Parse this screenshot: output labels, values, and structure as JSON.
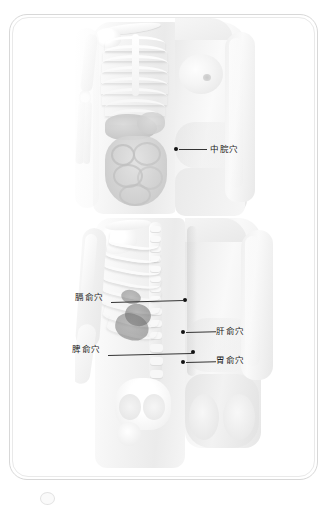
{
  "card": {
    "background_color": "#ffffff",
    "border_color": "#d8d8d8"
  },
  "panels": [
    {
      "id": "front-torso",
      "view": "anterior",
      "description": "Front view of female torso, left half showing ribcage and abdominal organs, right half showing skin",
      "labels": [
        {
          "name": "zhongwan",
          "text": "中脘穴",
          "dot": {
            "x": 163,
            "y": 131
          },
          "label": {
            "x": 199,
            "y": 126
          },
          "line": {
            "x": 168,
            "y": 131,
            "length": 28
          }
        }
      ]
    },
    {
      "id": "back-torso",
      "view": "posterior",
      "description": "Back view of female torso, left half showing ribcage, spine and pelvis, right half showing skin",
      "labels": [
        {
          "name": "geshu",
          "text": "膈俞穴",
          "dot": {
            "x": 181,
            "y": 296
          },
          "label": {
            "x": 72,
            "y": 288
          },
          "line": {
            "x": 108,
            "y": 297,
            "length": 73,
            "angle": -1.6
          }
        },
        {
          "name": "ganshu",
          "text": "肝俞穴",
          "dot": {
            "x": 179,
            "y": 328
          },
          "label": {
            "x": 213,
            "y": 322
          },
          "line": {
            "x": 184,
            "y": 329,
            "length": 29,
            "angle": -1.2
          }
        },
        {
          "name": "pishu",
          "text": "脾俞穴",
          "dot": {
            "x": 189,
            "y": 348
          },
          "label": {
            "x": 69,
            "y": 340
          },
          "line": {
            "x": 105,
            "y": 350,
            "length": 84,
            "angle": -1.4
          }
        },
        {
          "name": "weishu",
          "text": "胃俞穴",
          "dot": {
            "x": 179,
            "y": 358
          },
          "label": {
            "x": 213,
            "y": 351
          },
          "line": {
            "x": 184,
            "y": 359,
            "length": 29,
            "angle": -1.2
          }
        }
      ]
    }
  ],
  "colors": {
    "label_text": "#1a1a1a",
    "leader_line": "#333333",
    "marker_dot": "#111111",
    "bone": "#ffffff",
    "organ_shadow": "#9a9a9a",
    "skin_tone": "#eeeeee"
  }
}
